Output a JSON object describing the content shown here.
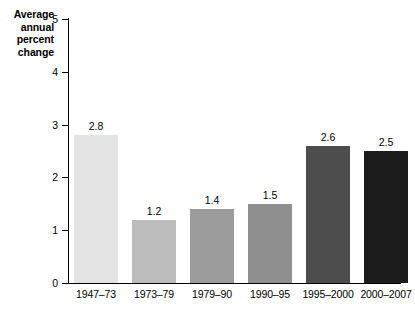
{
  "chart_data": {
    "type": "bar",
    "title": "",
    "xlabel": "",
    "ylabel": "Average annual percent change",
    "ylabel_lines": [
      "Average",
      "annual",
      "percent",
      "change"
    ],
    "categories": [
      "1947–73",
      "1973–79",
      "1979–90",
      "1990–95",
      "1995–2000",
      "2000–2007"
    ],
    "values": [
      2.8,
      1.2,
      1.4,
      1.5,
      2.6,
      2.5
    ],
    "value_labels": [
      "2.8",
      "1.2",
      "1.4",
      "1.5",
      "2.6",
      "2.5"
    ],
    "ylim": [
      0,
      5
    ],
    "yticks": [
      0,
      1,
      2,
      3,
      4,
      5
    ],
    "ytick_labels": [
      "0",
      "1",
      "2",
      "3",
      "4",
      "5"
    ],
    "grid": false,
    "legend": false,
    "bar_colors": [
      "#e4e4e4",
      "#bdbdbd",
      "#9c9c9c",
      "#8f8f8f",
      "#4d4d4d",
      "#1c1c1c"
    ]
  }
}
